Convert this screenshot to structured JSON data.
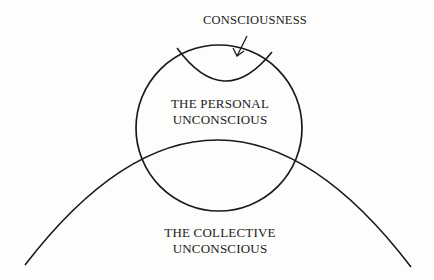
{
  "diagram": {
    "labels": {
      "consciousness": "CONSCIOUSNESS",
      "personal_unconscious": [
        "THE PERSONAL",
        "UNCONSCIOUS"
      ],
      "collective_unconscious": [
        "THE COLLECTIVE",
        "UNCONSCIOUS"
      ]
    },
    "shapes": {
      "personal_circle": {
        "cx": 219,
        "cy": 128,
        "r": 83
      },
      "collective_arc": {
        "start": [
          25,
          265
        ],
        "end": [
          411,
          267
        ],
        "peak": [
          218,
          139
        ]
      },
      "consciousness_arc": {
        "start": [
          177,
          48
        ],
        "end": [
          272,
          52
        ],
        "bottom": [
          225,
          79
        ]
      },
      "arrow": {
        "from": [
          247,
          36
        ],
        "to": [
          237,
          56
        ]
      }
    },
    "colors": {
      "stroke": "#1a1a1a",
      "background": "#fdfdfc"
    }
  }
}
